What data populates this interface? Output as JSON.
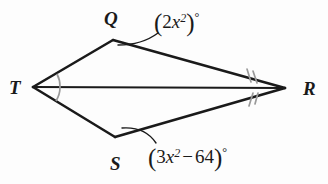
{
  "figure": {
    "type": "geometry-diagram",
    "shape": "kite",
    "background_color": "#fdfdfd",
    "stroke_color": "#1a1a1a",
    "arc_color": "#8c8c8c",
    "vertices": [
      {
        "name": "T",
        "label": "T",
        "x": 33,
        "y": 87
      },
      {
        "name": "Q",
        "label": "Q",
        "x": 113,
        "y": 40
      },
      {
        "name": "R",
        "label": "R",
        "x": 285,
        "y": 88
      },
      {
        "name": "S",
        "label": "S",
        "x": 115,
        "y": 137
      }
    ],
    "edges": [
      {
        "name": "side-TQ",
        "from": "T",
        "to": "Q"
      },
      {
        "name": "side-QR",
        "from": "Q",
        "to": "R"
      },
      {
        "name": "side-RS",
        "from": "R",
        "to": "S"
      },
      {
        "name": "side-ST",
        "from": "S",
        "to": "T"
      },
      {
        "name": "diagonal-TR",
        "from": "T",
        "to": "R"
      }
    ],
    "angle_marks": [
      {
        "name": "angle-T-upper",
        "vertex": "T",
        "style": "single-arc",
        "count": 1
      },
      {
        "name": "angle-T-lower",
        "vertex": "T",
        "style": "single-arc",
        "count": 1
      },
      {
        "name": "angle-R-upper",
        "vertex": "R",
        "style": "double-tick",
        "count": 2
      },
      {
        "name": "angle-R-lower",
        "vertex": "R",
        "style": "double-tick",
        "count": 2
      }
    ]
  },
  "labels": {
    "vertex_T": "T",
    "vertex_Q": "Q",
    "vertex_R": "R",
    "vertex_S": "S"
  },
  "expressions": {
    "angle_Q": {
      "text": "(2x²)°",
      "open_paren": "(",
      "coefficient": "2",
      "variable": "x",
      "exponent": "2",
      "close_paren": ")",
      "degree": "°",
      "points_to": "angle-Q"
    },
    "angle_S": {
      "text": "(3x² − 64)°",
      "open_paren": "(",
      "coefficient": "3",
      "variable": "x",
      "exponent": "2",
      "operator": "−",
      "constant": "64",
      "close_paren": ")",
      "degree": "°",
      "points_to": "angle-S"
    }
  }
}
